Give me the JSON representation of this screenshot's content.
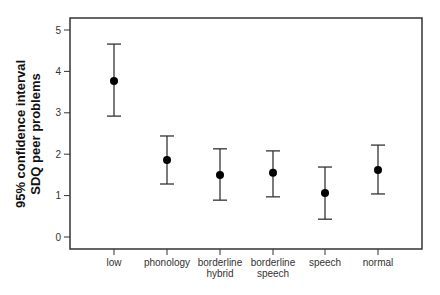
{
  "chart_data": {
    "type": "errorbar",
    "title": "",
    "xlabel": "",
    "ylabel": [
      "95% confidence interval",
      "SDQ peer problems"
    ],
    "ylim": [
      0,
      5
    ],
    "yticks": [
      0,
      1,
      2,
      3,
      4,
      5
    ],
    "grid": false,
    "categories": [
      [
        "low"
      ],
      [
        "phonology"
      ],
      [
        "borderline",
        "hybrid"
      ],
      [
        "borderline",
        "speech"
      ],
      [
        "speech"
      ],
      [
        "normal"
      ]
    ],
    "series": [
      {
        "name": "mean",
        "values": [
          3.77,
          1.86,
          1.5,
          1.55,
          1.06,
          1.62
        ]
      },
      {
        "name": "ci_upper",
        "values": [
          4.66,
          2.44,
          2.13,
          2.08,
          1.69,
          2.22
        ]
      },
      {
        "name": "ci_lower",
        "values": [
          2.92,
          1.28,
          0.89,
          0.97,
          0.43,
          1.04
        ]
      }
    ]
  }
}
